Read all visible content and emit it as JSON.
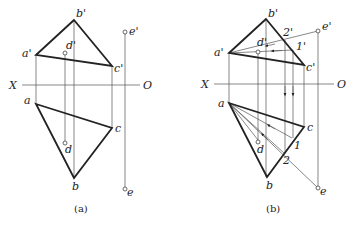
{
  "figures": [
    {
      "id": "a",
      "caption": "(a)",
      "axis": {
        "left_label": "X",
        "right_label": "O"
      },
      "labels": {
        "b_prime": "b'",
        "a_prime": "a'",
        "c_prime": "c'",
        "d_prime": "d'",
        "e_prime": "e'",
        "a": "a",
        "b": "b",
        "c": "c",
        "d": "d",
        "e": "e"
      }
    },
    {
      "id": "b",
      "caption": "(b)",
      "axis": {
        "left_label": "X",
        "right_label": "O"
      },
      "labels": {
        "b_prime": "b'",
        "a_prime": "a'",
        "c_prime": "c'",
        "d_prime": "d'",
        "e_prime": "e'",
        "one_prime": "1'",
        "two_prime": "2'",
        "a": "a",
        "b": "b",
        "c": "c",
        "d": "d",
        "e": "e",
        "one": "1",
        "two": "2"
      }
    }
  ]
}
